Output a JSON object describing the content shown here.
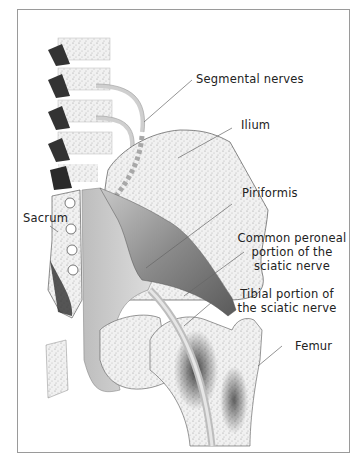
{
  "figure": {
    "labels": {
      "segmental_nerves": "Segmental nerves",
      "ilium": "Ilium",
      "piriformis": "Piriformis",
      "common_peroneal_1": "Common peroneal",
      "common_peroneal_2": "portion of the",
      "common_peroneal_3": "sciatic nerve",
      "sacrum": "Sacrum",
      "tibial_1": "Tibial portion of",
      "tibial_2": "the sciatic nerve",
      "femur": "Femur"
    },
    "colors": {
      "frame": "#9a9a9a",
      "bone_fill": "#e9e9e9",
      "bone_dark": "#2a2a2a",
      "muscle": "#8f8f8f",
      "nerve": "#d8d8d8",
      "leader_line": "#666666",
      "text": "#222222"
    }
  }
}
